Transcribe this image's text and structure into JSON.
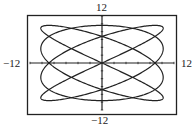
{
  "chart_data": {
    "type": "line",
    "title": "",
    "xlabel": "",
    "ylabel": "",
    "xlim": [
      -12,
      12
    ],
    "ylim": [
      -12,
      12
    ],
    "tick_labels": {
      "x_min": "−12",
      "x_max": "12",
      "y_min": "−12",
      "y_max": "12"
    },
    "grid": false,
    "axes_ticks": true,
    "parametric": {
      "x_amplitude": 10.2,
      "x_frequency": 4,
      "y_amplitude": 9.6,
      "y_frequency": 3,
      "t_range": [
        0,
        6.2832
      ]
    },
    "x_axis_crossings": [
      -8.9,
      -3.1,
      3.1,
      8.9
    ],
    "y_axis_crossings": [
      5.4,
      -5.4
    ]
  },
  "colors": {
    "curve": "#222222",
    "frame": "#222222",
    "background": "#ffffff"
  }
}
